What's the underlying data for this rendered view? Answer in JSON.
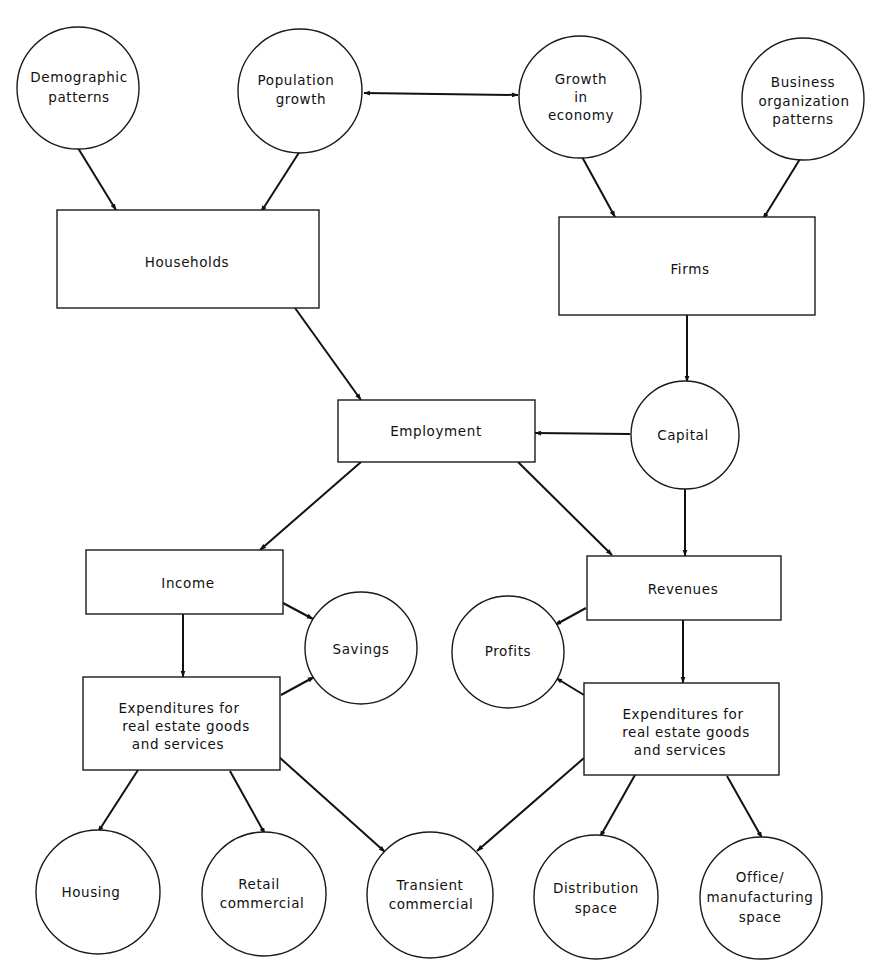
{
  "diagram": {
    "colors": {
      "stroke": "#1a1a1a",
      "background": "#ffffff",
      "text": "#111111"
    },
    "nodes": {
      "demographic_patterns": {
        "shape": "circle",
        "lines": [
          "Demographic",
          "patterns"
        ]
      },
      "population_growth": {
        "shape": "circle",
        "lines": [
          "Population",
          "growth"
        ]
      },
      "growth_in_economy": {
        "shape": "circle",
        "lines": [
          "Growth",
          "in",
          "economy"
        ]
      },
      "business_organization_patterns": {
        "shape": "circle",
        "lines": [
          "Business",
          "organization",
          "patterns"
        ]
      },
      "households": {
        "shape": "rect",
        "lines": [
          "Households"
        ]
      },
      "firms": {
        "shape": "rect",
        "lines": [
          "Firms"
        ]
      },
      "employment": {
        "shape": "rect",
        "lines": [
          "Employment"
        ]
      },
      "capital": {
        "shape": "circle",
        "lines": [
          "Capital"
        ]
      },
      "income": {
        "shape": "rect",
        "lines": [
          "Income"
        ]
      },
      "savings": {
        "shape": "circle",
        "lines": [
          "Savings"
        ]
      },
      "revenues": {
        "shape": "rect",
        "lines": [
          "Revenues"
        ]
      },
      "profits": {
        "shape": "circle",
        "lines": [
          "Profits"
        ]
      },
      "expenditures_households": {
        "shape": "rect",
        "lines": [
          "Expenditures for",
          "real estate goods",
          "and services"
        ]
      },
      "expenditures_firms": {
        "shape": "rect",
        "lines": [
          "Expenditures for",
          "real estate goods",
          "and services"
        ]
      },
      "housing": {
        "shape": "circle",
        "lines": [
          "Housing"
        ]
      },
      "retail_commercial": {
        "shape": "circle",
        "lines": [
          "Retail",
          "commercial"
        ]
      },
      "transient_commercial": {
        "shape": "circle",
        "lines": [
          "Transient",
          "commercial"
        ]
      },
      "distribution_space": {
        "shape": "circle",
        "lines": [
          "Distribution",
          "space"
        ]
      },
      "office_manufacturing_space": {
        "shape": "circle",
        "lines": [
          "Office/",
          "manufacturing",
          "space"
        ]
      }
    },
    "edges": [
      {
        "from": "demographic_patterns",
        "to": "households",
        "type": "directed"
      },
      {
        "from": "population_growth",
        "to": "households",
        "type": "directed"
      },
      {
        "from": "population_growth",
        "to": "growth_in_economy",
        "type": "bidirectional"
      },
      {
        "from": "growth_in_economy",
        "to": "firms",
        "type": "directed"
      },
      {
        "from": "business_organization_patterns",
        "to": "firms",
        "type": "directed"
      },
      {
        "from": "households",
        "to": "employment",
        "type": "directed"
      },
      {
        "from": "firms",
        "to": "capital",
        "type": "directed"
      },
      {
        "from": "capital",
        "to": "employment",
        "type": "directed"
      },
      {
        "from": "capital",
        "to": "revenues",
        "type": "directed"
      },
      {
        "from": "employment",
        "to": "income",
        "type": "directed"
      },
      {
        "from": "employment",
        "to": "revenues",
        "type": "directed"
      },
      {
        "from": "income",
        "to": "savings",
        "type": "directed"
      },
      {
        "from": "income",
        "to": "expenditures_households",
        "type": "directed"
      },
      {
        "from": "expenditures_households",
        "to": "savings",
        "type": "directed"
      },
      {
        "from": "revenues",
        "to": "profits",
        "type": "directed"
      },
      {
        "from": "revenues",
        "to": "expenditures_firms",
        "type": "directed"
      },
      {
        "from": "expenditures_firms",
        "to": "profits",
        "type": "directed"
      },
      {
        "from": "expenditures_households",
        "to": "housing",
        "type": "directed"
      },
      {
        "from": "expenditures_households",
        "to": "retail_commercial",
        "type": "directed"
      },
      {
        "from": "expenditures_households",
        "to": "transient_commercial",
        "type": "directed"
      },
      {
        "from": "expenditures_firms",
        "to": "transient_commercial",
        "type": "directed"
      },
      {
        "from": "expenditures_firms",
        "to": "distribution_space",
        "type": "directed"
      },
      {
        "from": "expenditures_firms",
        "to": "office_manufacturing_space",
        "type": "directed"
      }
    ]
  }
}
